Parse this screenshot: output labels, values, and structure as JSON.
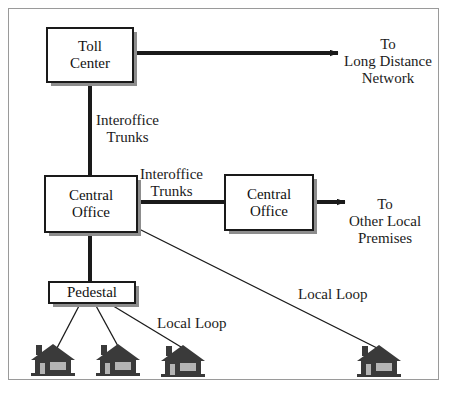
{
  "diagram": {
    "colors": {
      "line": "#1a1a1a",
      "box_border": "#1a1a1a",
      "box_fill": "#ffffff",
      "box_shadow": "#8d8d8d",
      "frame_border": "#9a9a9a",
      "house_fill": "#3a3a3a",
      "house_detail": "#b4b4b4",
      "text": "#111111"
    },
    "nodes": [
      {
        "id": "toll-center",
        "lines": [
          "Toll",
          "Center"
        ]
      },
      {
        "id": "central-office-main",
        "lines": [
          "Central",
          "Office"
        ]
      },
      {
        "id": "central-office-remote",
        "lines": [
          "Central",
          "Office"
        ]
      },
      {
        "id": "pedestal",
        "lines": [
          "Pedestal"
        ]
      }
    ],
    "edge_labels": [
      {
        "id": "interoffice-vertical",
        "lines": [
          "Interoffice",
          "Trunks"
        ]
      },
      {
        "id": "interoffice-horizontal",
        "lines": [
          "Interoffice",
          "Trunks"
        ]
      },
      {
        "id": "local-loop-near",
        "lines": [
          "Local Loop"
        ]
      },
      {
        "id": "local-loop-far",
        "lines": [
          "Local Loop"
        ]
      }
    ],
    "destinations": [
      {
        "id": "long-distance",
        "lines": [
          "To",
          "Long Distance",
          "Network"
        ]
      },
      {
        "id": "other-local",
        "lines": [
          "To",
          "Other Local",
          "Premises"
        ]
      }
    ],
    "premises": [
      {
        "id": "house-1",
        "icon": "house-icon"
      },
      {
        "id": "house-2",
        "icon": "house-icon"
      },
      {
        "id": "house-3",
        "icon": "house-icon"
      },
      {
        "id": "house-4",
        "icon": "house-icon"
      }
    ]
  }
}
